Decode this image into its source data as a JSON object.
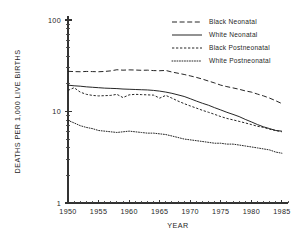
{
  "chart_data": {
    "type": "line",
    "title": "",
    "xlabel": "YEAR",
    "ylabel": "DEATHS PER 1,000 LIVE BIRTHS",
    "yscale": "log",
    "ylim": [
      1,
      100
    ],
    "xlim": [
      1950,
      1986
    ],
    "grid": false,
    "legend_position": "top-right",
    "y_tick_labels": [
      "100",
      "10",
      "1"
    ],
    "y_tick_values": [
      100,
      10,
      1
    ],
    "x_tick_labels": [
      "1950",
      "1955",
      "1960",
      "1965",
      "1970",
      "1975",
      "1980",
      "1985"
    ],
    "x_tick_values": [
      1950,
      1955,
      1960,
      1965,
      1970,
      1975,
      1980,
      1985
    ],
    "x": [
      1950,
      1951,
      1952,
      1953,
      1954,
      1955,
      1956,
      1957,
      1958,
      1959,
      1960,
      1961,
      1962,
      1963,
      1964,
      1965,
      1966,
      1967,
      1968,
      1969,
      1970,
      1971,
      1972,
      1973,
      1974,
      1975,
      1976,
      1977,
      1978,
      1979,
      1980,
      1981,
      1982,
      1983,
      1984,
      1985
    ],
    "series": [
      {
        "name": "Black Neonatal",
        "style": "longdash",
        "values": [
          27.5,
          27.3,
          27.2,
          27.4,
          27.3,
          27.2,
          27.4,
          27.8,
          28.6,
          28.3,
          28.5,
          28.4,
          28.2,
          28.3,
          28.0,
          27.9,
          28.1,
          27.0,
          26.2,
          25.4,
          24.5,
          23.6,
          22.6,
          21.5,
          20.5,
          19.4,
          18.7,
          18.1,
          17.5,
          16.8,
          16.3,
          15.5,
          14.8,
          14.0,
          13.1,
          12.2
        ]
      },
      {
        "name": "White Neonatal",
        "style": "solid",
        "values": [
          19.4,
          19.1,
          18.9,
          18.6,
          18.4,
          18.2,
          18.0,
          17.9,
          17.8,
          17.6,
          17.5,
          17.4,
          17.3,
          17.2,
          17.0,
          16.7,
          16.3,
          15.8,
          15.2,
          14.6,
          13.8,
          13.0,
          12.3,
          11.7,
          11.0,
          10.4,
          9.8,
          9.3,
          8.8,
          8.2,
          7.7,
          7.2,
          6.8,
          6.5,
          6.2,
          6.1
        ]
      },
      {
        "name": "Black Postneonatal",
        "style": "shortdash",
        "values": [
          17.0,
          18.2,
          16.3,
          15.4,
          15.0,
          14.8,
          14.9,
          15.0,
          15.4,
          14.2,
          15.2,
          15.4,
          15.3,
          15.2,
          15.1,
          14.0,
          15.0,
          14.0,
          13.0,
          12.2,
          11.5,
          10.9,
          10.3,
          9.8,
          9.3,
          8.8,
          8.4,
          8.1,
          7.8,
          7.5,
          7.2,
          6.9,
          6.7,
          6.4,
          6.2,
          6.0
        ]
      },
      {
        "name": "White Postneonatal",
        "style": "dotted",
        "values": [
          8.0,
          7.5,
          7.0,
          6.7,
          6.5,
          6.2,
          6.1,
          6.0,
          5.9,
          6.0,
          6.1,
          6.0,
          5.9,
          5.8,
          5.8,
          5.7,
          5.6,
          5.4,
          5.2,
          5.0,
          4.9,
          4.8,
          4.7,
          4.6,
          4.5,
          4.5,
          4.4,
          4.4,
          4.3,
          4.2,
          4.1,
          4.0,
          3.9,
          3.8,
          3.6,
          3.5
        ]
      }
    ]
  },
  "legend": {
    "entries": [
      {
        "label": "Black Neonatal",
        "style": "longdash"
      },
      {
        "label": "White Neonatal",
        "style": "solid"
      },
      {
        "label": "Black Postneonatal",
        "style": "shortdash"
      },
      {
        "label": "White Postneonatal",
        "style": "dotted"
      }
    ]
  },
  "colors": {
    "ink": "#1a1a1a",
    "axis": "#333333",
    "background": "#ffffff"
  }
}
